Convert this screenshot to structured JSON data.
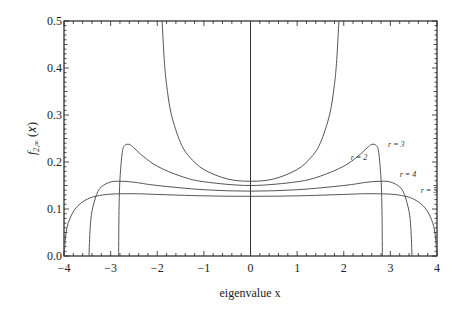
{
  "chart_data": {
    "type": "line",
    "title": "",
    "xlabel": "eigenvalue x",
    "ylabel": "f_{2,∞}(x)",
    "xlim": [
      -4,
      4
    ],
    "ylim": [
      0,
      0.5
    ],
    "grid": false,
    "legend": "inline labels near right side of curves",
    "x_ticks": [
      -4,
      -3,
      -2,
      -1,
      0,
      1,
      2,
      3,
      4
    ],
    "x_tick_labels": [
      "−4",
      "−3",
      "−2",
      "−1",
      "0",
      "1",
      "2",
      "3",
      "4"
    ],
    "y_ticks": [
      0,
      0.1,
      0.2,
      0.3,
      0.4,
      0.5
    ],
    "y_tick_labels": [
      "0.0",
      "0.1",
      "0.2",
      "0.3",
      "0.4",
      "0.5"
    ],
    "vertical_line_at_x": 0,
    "series": [
      {
        "name": "r = 2",
        "label_pos": [
          2.15,
          0.205
        ],
        "symmetric": true,
        "x": [
          0,
          0.5,
          1.0,
          1.3,
          1.5,
          1.7,
          1.8,
          1.85,
          1.896
        ],
        "y": [
          0.159,
          0.164,
          0.184,
          0.21,
          0.241,
          0.302,
          0.365,
          0.418,
          0.5
        ]
      },
      {
        "name": "r = 3",
        "label_pos": [
          2.95,
          0.232
        ],
        "symmetric": true,
        "x": [
          0,
          1.0,
          1.5,
          2.0,
          2.3,
          2.5,
          2.6,
          2.7,
          2.75,
          2.8,
          2.82,
          2.828
        ],
        "y": [
          0.15,
          0.158,
          0.17,
          0.191,
          0.212,
          0.23,
          0.2375,
          0.235,
          0.22,
          0.163,
          0.097,
          0.0
        ]
      },
      {
        "name": "r = 4",
        "label_pos": [
          3.2,
          0.168
        ],
        "symmetric": true,
        "x": [
          0,
          1.0,
          2.0,
          2.5,
          2.8,
          3.0,
          3.2,
          3.3,
          3.4,
          3.44,
          3.464
        ],
        "y": [
          0.138,
          0.141,
          0.15,
          0.157,
          0.159,
          0.1575,
          0.147,
          0.131,
          0.095,
          0.058,
          0.0
        ]
      },
      {
        "name": "r = 5",
        "label_pos": [
          3.65,
          0.133
        ],
        "symmetric": true,
        "x": [
          0,
          1.0,
          2.0,
          2.5,
          3.0,
          3.3,
          3.5,
          3.7,
          3.85,
          3.95,
          4.0
        ],
        "y": [
          0.127,
          0.128,
          0.131,
          0.1325,
          0.1316,
          0.1275,
          0.121,
          0.107,
          0.085,
          0.053,
          0.0
        ]
      }
    ]
  }
}
